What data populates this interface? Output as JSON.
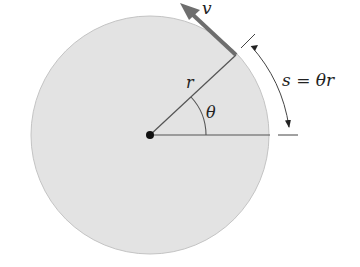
{
  "diagram": {
    "labels": {
      "velocity": "v",
      "radius": "r",
      "angle": "θ",
      "arc_length": "s = θr"
    },
    "colors": {
      "disk_fill": "#e3e3e3",
      "disk_edge": "#bdbdbd",
      "line": "#555555",
      "arrow": "#6e6e6e",
      "text": "#222222"
    }
  }
}
